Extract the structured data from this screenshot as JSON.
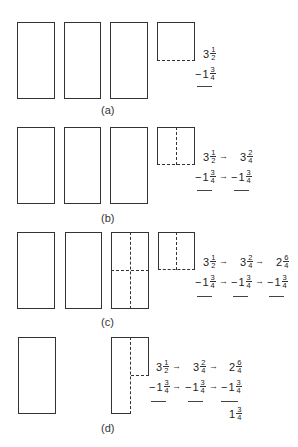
{
  "panels": [
    {
      "id": "a",
      "caption": "(a)",
      "columns": [
        {
          "top": {
            "whole": "3",
            "num": "1",
            "den": "2"
          },
          "bottom": {
            "sign": "−",
            "whole": "1",
            "num": "3",
            "den": "4"
          }
        }
      ],
      "result": null
    },
    {
      "id": "b",
      "caption": "(b)",
      "columns": [
        {
          "top": {
            "whole": "3",
            "num": "1",
            "den": "2"
          },
          "bottom": {
            "sign": "−",
            "whole": "1",
            "num": "3",
            "den": "4"
          }
        },
        {
          "top": {
            "whole": "3",
            "num": "2",
            "den": "4"
          },
          "bottom": {
            "sign": "−",
            "whole": "1",
            "num": "3",
            "den": "4"
          }
        }
      ],
      "result": null
    },
    {
      "id": "c",
      "caption": "(c)",
      "columns": [
        {
          "top": {
            "whole": "3",
            "num": "1",
            "den": "2"
          },
          "bottom": {
            "sign": "−",
            "whole": "1",
            "num": "3",
            "den": "4"
          }
        },
        {
          "top": {
            "whole": "3",
            "num": "2",
            "den": "4"
          },
          "bottom": {
            "sign": "−",
            "whole": "1",
            "num": "3",
            "den": "4"
          }
        },
        {
          "top": {
            "whole": "2",
            "num": "6",
            "den": "4"
          },
          "bottom": {
            "sign": "−",
            "whole": "1",
            "num": "3",
            "den": "4"
          }
        }
      ],
      "result": null
    },
    {
      "id": "d",
      "caption": "(d)",
      "columns": [
        {
          "top": {
            "whole": "3",
            "num": "1",
            "den": "2"
          },
          "bottom": {
            "sign": "−",
            "whole": "1",
            "num": "3",
            "den": "4"
          }
        },
        {
          "top": {
            "whole": "3",
            "num": "2",
            "den": "4"
          },
          "bottom": {
            "sign": "−",
            "whole": "1",
            "num": "3",
            "den": "4"
          }
        },
        {
          "top": {
            "whole": "2",
            "num": "6",
            "den": "4"
          },
          "bottom": {
            "sign": "−",
            "whole": "1",
            "num": "3",
            "den": "4"
          }
        }
      ],
      "result": {
        "whole": "1",
        "num": "3",
        "den": "4"
      }
    }
  ],
  "arrow_glyph": "→"
}
